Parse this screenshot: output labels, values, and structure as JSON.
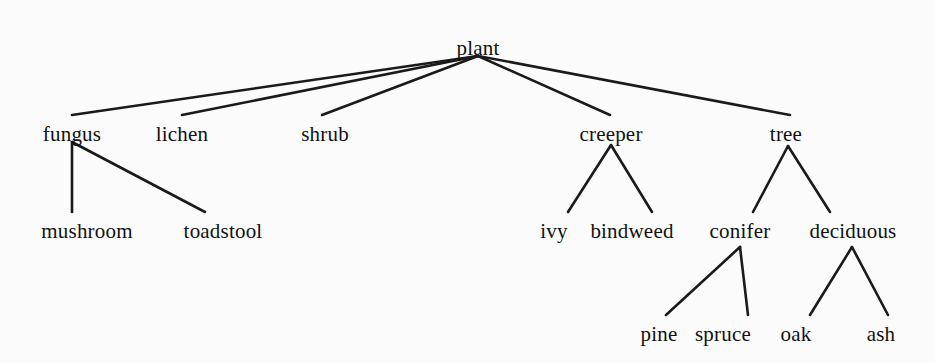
{
  "diagram": {
    "kind": "taxonomy-tree",
    "title": "plant",
    "background_color": "#fbfbfb",
    "edge_color": "#1a1a1a",
    "text_color": "#111111"
  },
  "nodes": [
    {
      "id": "plant",
      "label": "plant",
      "x": 478,
      "y": 38,
      "anchor_x": 478,
      "anchor_y": 56,
      "attach_y": 115,
      "level": 0
    },
    {
      "id": "fungus",
      "label": "fungus",
      "x": 72,
      "y": 124,
      "anchor_x": 72,
      "anchor_y": 142,
      "attach_y": 212,
      "level": 1
    },
    {
      "id": "lichen",
      "label": "lichen",
      "x": 182,
      "y": 124,
      "anchor_x": 182,
      "anchor_y": 142,
      "attach_y": 212,
      "level": 1
    },
    {
      "id": "shrub",
      "label": "shrub",
      "x": 325,
      "y": 124,
      "anchor_x": 325,
      "anchor_y": 142,
      "attach_y": 212,
      "level": 1
    },
    {
      "id": "creeper",
      "label": "creeper",
      "x": 611,
      "y": 124,
      "anchor_x": 611,
      "anchor_y": 145,
      "attach_y": 212,
      "level": 1
    },
    {
      "id": "tree",
      "label": "tree",
      "x": 786,
      "y": 124,
      "anchor_x": 788,
      "anchor_y": 146,
      "attach_y": 212,
      "level": 1
    },
    {
      "id": "mushroom",
      "label": "mushroom",
      "x": 87,
      "y": 221,
      "anchor_x": 72,
      "anchor_y": 212,
      "attach_y": 315,
      "level": 2
    },
    {
      "id": "toadstool",
      "label": "toadstool",
      "x": 223,
      "y": 221,
      "anchor_x": 205,
      "anchor_y": 212,
      "attach_y": 315,
      "level": 2
    },
    {
      "id": "ivy",
      "label": "ivy",
      "x": 554,
      "y": 221,
      "anchor_x": 568,
      "anchor_y": 212,
      "attach_y": 315,
      "level": 2
    },
    {
      "id": "bindweed",
      "label": "bindweed",
      "x": 632,
      "y": 221,
      "anchor_x": 652,
      "anchor_y": 212,
      "attach_y": 315,
      "level": 2
    },
    {
      "id": "conifer",
      "label": "conifer",
      "x": 740,
      "y": 221,
      "anchor_x": 740,
      "anchor_y": 247,
      "attach_y": 315,
      "level": 2
    },
    {
      "id": "deciduous",
      "label": "deciduous",
      "x": 853,
      "y": 221,
      "anchor_x": 852,
      "anchor_y": 247,
      "attach_y": 315,
      "level": 2
    },
    {
      "id": "pine",
      "label": "pine",
      "x": 659,
      "y": 324,
      "anchor_x": 666,
      "anchor_y": 315,
      "attach_y": 0,
      "level": 3
    },
    {
      "id": "spruce",
      "label": "spruce",
      "x": 723,
      "y": 324,
      "anchor_x": 748,
      "anchor_y": 315,
      "attach_y": 0,
      "level": 3
    },
    {
      "id": "oak",
      "label": "oak",
      "x": 796,
      "y": 324,
      "anchor_x": 810,
      "anchor_y": 315,
      "attach_y": 0,
      "level": 3
    },
    {
      "id": "ash",
      "label": "ash",
      "x": 881,
      "y": 324,
      "anchor_x": 888,
      "anchor_y": 315,
      "attach_y": 0,
      "level": 3
    }
  ],
  "edges": [
    {
      "from": "plant",
      "to": "fungus",
      "x1": 478,
      "y1": 56,
      "x2": 72,
      "y2": 115
    },
    {
      "from": "plant",
      "to": "lichen",
      "x1": 478,
      "y1": 56,
      "x2": 182,
      "y2": 115
    },
    {
      "from": "plant",
      "to": "shrub",
      "x1": 478,
      "y1": 56,
      "x2": 322,
      "y2": 115
    },
    {
      "from": "plant",
      "to": "creeper",
      "x1": 478,
      "y1": 56,
      "x2": 610,
      "y2": 115
    },
    {
      "from": "plant",
      "to": "tree",
      "x1": 478,
      "y1": 56,
      "x2": 790,
      "y2": 115
    },
    {
      "from": "fungus",
      "to": "mushroom",
      "x1": 72,
      "y1": 142,
      "x2": 72,
      "y2": 212
    },
    {
      "from": "fungus",
      "to": "toadstool",
      "x1": 72,
      "y1": 142,
      "x2": 205,
      "y2": 212
    },
    {
      "from": "creeper",
      "to": "ivy",
      "x1": 611,
      "y1": 145,
      "x2": 568,
      "y2": 212
    },
    {
      "from": "creeper",
      "to": "bindweed",
      "x1": 611,
      "y1": 145,
      "x2": 652,
      "y2": 212
    },
    {
      "from": "tree",
      "to": "conifer",
      "x1": 788,
      "y1": 146,
      "x2": 753,
      "y2": 212
    },
    {
      "from": "tree",
      "to": "deciduous",
      "x1": 788,
      "y1": 146,
      "x2": 830,
      "y2": 212
    },
    {
      "from": "conifer",
      "to": "pine",
      "x1": 740,
      "y1": 247,
      "x2": 666,
      "y2": 315
    },
    {
      "from": "conifer",
      "to": "spruce",
      "x1": 740,
      "y1": 247,
      "x2": 748,
      "y2": 315
    },
    {
      "from": "deciduous",
      "to": "oak",
      "x1": 852,
      "y1": 247,
      "x2": 810,
      "y2": 315
    },
    {
      "from": "deciduous",
      "to": "ash",
      "x1": 852,
      "y1": 247,
      "x2": 888,
      "y2": 315
    }
  ]
}
